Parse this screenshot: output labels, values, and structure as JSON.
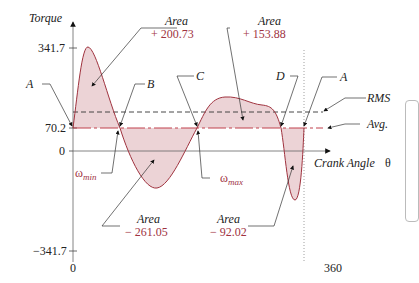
{
  "diagram": {
    "y_axis_title": "Torque",
    "x_axis_title": "Crank Angle",
    "x_axis_symbol": "θ",
    "y_ticks": [
      {
        "label": "341.7",
        "value": 341.7
      },
      {
        "label": "70.2",
        "value": 70.2
      },
      {
        "label": "0",
        "value": 0
      },
      {
        "label": "−341.7",
        "value": -341.7
      }
    ],
    "x_ticks": [
      {
        "label": "0",
        "value": 0
      },
      {
        "label": "360",
        "value": 360
      }
    ],
    "points": {
      "A_left": "A",
      "B": "B",
      "C": "C",
      "D": "D",
      "A_right": "A"
    },
    "lines": {
      "rms": "RMS",
      "avg": "Avg."
    },
    "omega": {
      "min_symbol": "ω",
      "min_sub": "min",
      "max_symbol": "ω",
      "max_sub": "max"
    },
    "areas": [
      {
        "title": "Area",
        "value": "+ 200.73"
      },
      {
        "title": "Area",
        "value": "+ 153.88"
      },
      {
        "title": "Area",
        "value": "− 261.05"
      },
      {
        "title": "Area",
        "value": "− 92.02"
      }
    ],
    "colors": {
      "curve": "#a0333f",
      "fill": "#e9cfd2",
      "axis": "#555555",
      "avg_line": "#c0404c"
    }
  }
}
